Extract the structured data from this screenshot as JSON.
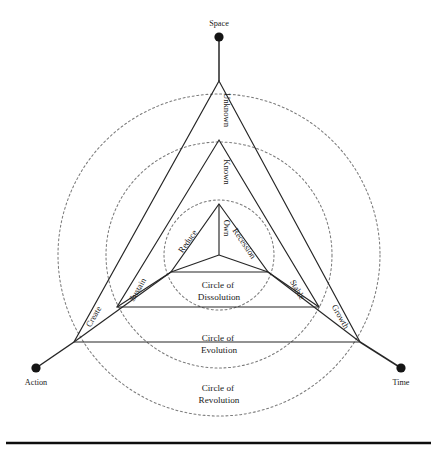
{
  "diagram": {
    "center": {
      "x": 219,
      "y": 255
    },
    "outer_nodes": [
      {
        "id": "space",
        "label": "Space",
        "dot": {
          "x": 219,
          "y": 37
        },
        "label_pos": {
          "x": 219,
          "y": 26
        },
        "anchor": "middle"
      },
      {
        "id": "action",
        "label": "Action",
        "dot": {
          "x": 36,
          "y": 368
        },
        "label_pos": {
          "x": 36,
          "y": 385
        },
        "anchor": "middle"
      },
      {
        "id": "time",
        "label": "Time",
        "dot": {
          "x": 401,
          "y": 368
        },
        "label_pos": {
          "x": 401,
          "y": 385
        },
        "anchor": "middle"
      }
    ],
    "rings": [
      {
        "id": "revolution",
        "caption_line1": "Circle of",
        "caption_line2": "Revolution",
        "radius": 161,
        "caption_pos": {
          "x": 219,
          "y": 391
        }
      },
      {
        "id": "evolution",
        "caption_line1": "Circle of",
        "caption_line2": "Evolution",
        "radius": 113,
        "caption_pos": {
          "x": 219,
          "y": 341
        }
      },
      {
        "id": "dissolution",
        "caption_line1": "Circle of",
        "caption_line2": "Dissolution",
        "radius": 55,
        "caption_pos": {
          "x": 219,
          "y": 288
        }
      }
    ],
    "triangles": [
      {
        "id": "outer",
        "apex": {
          "x": 219,
          "y": 81
        },
        "left": {
          "x": 74,
          "y": 342
        },
        "right": {
          "x": 360,
          "y": 342
        }
      },
      {
        "id": "middle",
        "apex": {
          "x": 219,
          "y": 140
        },
        "left": {
          "x": 117,
          "y": 307
        },
        "right": {
          "x": 319,
          "y": 307
        }
      },
      {
        "id": "inner",
        "apex": {
          "x": 219,
          "y": 204
        },
        "left": {
          "x": 171,
          "y": 272
        },
        "right": {
          "x": 268,
          "y": 272
        }
      }
    ],
    "axis_labels": [
      {
        "id": "unknown",
        "label": "Unknown",
        "x": 224,
        "y": 110,
        "rotate": 90
      },
      {
        "id": "known",
        "label": "Known",
        "x": 224,
        "y": 172,
        "rotate": 90
      },
      {
        "id": "own",
        "label": "Own",
        "x": 224,
        "y": 228,
        "rotate": 90
      }
    ],
    "edge_labels": [
      {
        "id": "create",
        "label": "Create",
        "x": 96,
        "y": 318,
        "rotate": -60
      },
      {
        "id": "sustain",
        "label": "Sustain",
        "x": 140,
        "y": 291,
        "rotate": -60
      },
      {
        "id": "reduce",
        "label": "Reduce",
        "x": 190,
        "y": 243,
        "rotate": -55
      },
      {
        "id": "recession",
        "label": "Recession",
        "x": 242,
        "y": 245,
        "rotate": 56
      },
      {
        "id": "stable",
        "label": "Stable",
        "x": 295,
        "y": 291,
        "rotate": 60
      },
      {
        "id": "growth",
        "label": "Growth",
        "x": 338,
        "y": 318,
        "rotate": 60
      }
    ],
    "base_rule": {
      "x1": 6,
      "y1": 443,
      "x2": 431,
      "y2": 443
    },
    "colors": {
      "line": "#262626",
      "ring": "#7b7b7b",
      "dot": "#151515",
      "text": "#1a1a1a",
      "rule": "#0d0d0d",
      "background": "#ffffff"
    }
  }
}
